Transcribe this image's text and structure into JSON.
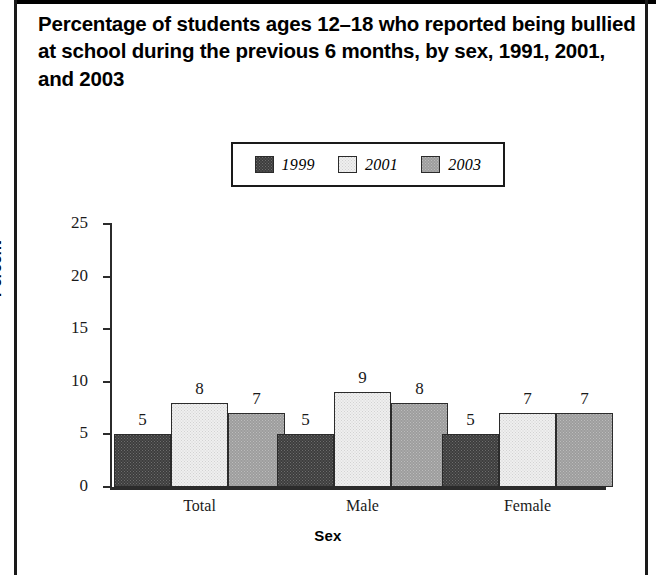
{
  "title": "Percentage of students ages 12–18 who reported being bullied at school during the previous 6 months, by sex, 1991, 2001, and 2003",
  "chart_data": {
    "type": "bar",
    "title": "Percentage of students ages 12–18 who reported being bullied at school during the previous 6 months, by sex, 1991, 2001, and 2003",
    "xlabel": "Sex",
    "ylabel": "Percent",
    "categories": [
      "Total",
      "Male",
      "Female"
    ],
    "series": [
      {
        "name": "1999",
        "values": [
          5,
          5,
          5
        ],
        "color": "#4a4a4a"
      },
      {
        "name": "2001",
        "values": [
          8,
          9,
          7
        ],
        "color": "#e9e9e9"
      },
      {
        "name": "2003",
        "values": [
          7,
          8,
          7
        ],
        "color": "#a6a6a6"
      }
    ],
    "ylim": [
      0,
      25
    ],
    "yticks": [
      0,
      5,
      10,
      15,
      20,
      25
    ],
    "ytick_labels": [
      "0",
      "5",
      "10",
      "15",
      "20",
      "25"
    ],
    "grid": false,
    "legend_position": "top-center",
    "bar_value_labels": true
  },
  "legend": {
    "items": [
      {
        "label": "1999",
        "swatch": "dark-pattern-swatch"
      },
      {
        "label": "2001",
        "swatch": "light-pattern-swatch"
      },
      {
        "label": "2003",
        "swatch": "medium-pattern-swatch"
      }
    ]
  },
  "axes": {
    "y_label": "Percent",
    "x_label": "Sex",
    "y_ticks": [
      "25",
      "20",
      "15",
      "10",
      "5",
      "0"
    ],
    "x_categories": [
      "Total",
      "Male",
      "Female"
    ]
  },
  "values": {
    "total": {
      "y1999": "5",
      "y2001": "8",
      "y2003": "7"
    },
    "male": {
      "y1999": "5",
      "y2001": "9",
      "y2003": "8"
    },
    "female": {
      "y1999": "5",
      "y2001": "7",
      "y2003": "7"
    }
  },
  "colors": {
    "series_1999": "#4a4a4a",
    "series_2001": "#e9e9e9",
    "series_2003": "#a6a6a6",
    "axis": "#2b2b2b",
    "rule": "#1a1a1a"
  }
}
